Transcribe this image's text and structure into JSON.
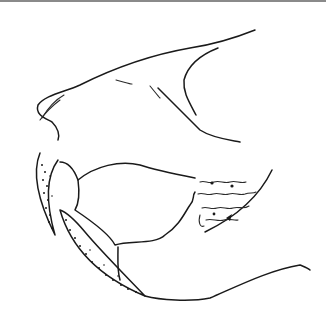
{
  "illustration": {
    "subject": "line drawing of a skull / jaw in profile with stippled shading",
    "background": "#ffffff",
    "stroke_color": "#1a1a1a",
    "top_rule_color": "#8a8a8a"
  }
}
